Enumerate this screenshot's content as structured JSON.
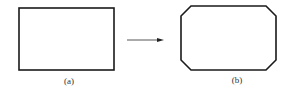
{
  "diagram": {
    "stroke_color": "#1a1a1a",
    "left": {
      "shape": "rectangle",
      "label": "(a)"
    },
    "arrow": {
      "direction": "right"
    },
    "right": {
      "shape": "octagon (rectangle with chamfered corners)",
      "label": "(b)"
    }
  }
}
